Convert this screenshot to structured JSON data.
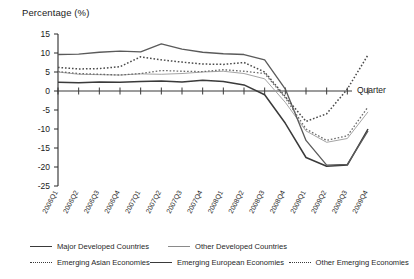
{
  "chart_data": {
    "type": "line",
    "title": "",
    "ylabel": "Percentage (%)",
    "xlabel": "Quarter",
    "ylim": [
      -25,
      15
    ],
    "yticks": [
      15,
      10,
      5,
      0,
      -5,
      -10,
      -15,
      -20,
      -25
    ],
    "grid": false,
    "legend_position": "bottom",
    "categories": [
      "2006Q1",
      "2006Q2",
      "2006Q3",
      "2006Q4",
      "2007Q1",
      "2007Q2",
      "2007Q3",
      "2007Q4",
      "2008Q1",
      "2008Q2",
      "2008Q3",
      "2008Q4",
      "2009Q1",
      "2009Q2",
      "2009Q3",
      "2009Q4"
    ],
    "series": [
      {
        "name": "Major Developed Countries",
        "style": "solid",
        "color": "#3a3a3a",
        "width": 1.5,
        "values": [
          2.3,
          2.2,
          2.4,
          2.3,
          2.5,
          2.6,
          2.4,
          2.8,
          2.5,
          1.6,
          -1.0,
          -8.5,
          -17.5,
          -19.8,
          -19.5,
          -10.0
        ]
      },
      {
        "name": "Other Developed Countries",
        "style": "solid",
        "color": "#9a9a9a",
        "width": 0.9,
        "values": [
          5.0,
          4.4,
          4.3,
          4.2,
          4.5,
          4.4,
          4.6,
          5.0,
          5.2,
          4.6,
          3.2,
          -3.0,
          -10.5,
          -13.5,
          -12.5,
          -5.5
        ]
      },
      {
        "name": "Emerging Asian Economies",
        "style": "dotted",
        "color": "#4a4a4a",
        "width": 1.5,
        "values": [
          6.2,
          5.8,
          5.9,
          6.4,
          9.0,
          8.2,
          7.6,
          7.1,
          7.0,
          7.5,
          5.0,
          -1.5,
          -8.0,
          -6.0,
          0.5,
          9.5
        ]
      },
      {
        "name": "Emerging European Economies",
        "style": "solid",
        "color": "#5a5a5a",
        "width": 1.3,
        "values": [
          9.6,
          9.7,
          10.2,
          10.5,
          10.3,
          12.4,
          11.0,
          10.2,
          9.8,
          9.6,
          8.2,
          0.5,
          -13.0,
          -19.5,
          -19.3,
          -10.5
        ]
      },
      {
        "name": "Other Emerging Economies",
        "style": "dotted",
        "color": "#6a6a6a",
        "width": 1.3,
        "values": [
          5.1,
          4.6,
          4.4,
          4.2,
          4.6,
          5.4,
          5.2,
          5.1,
          5.6,
          5.2,
          4.6,
          -1.8,
          -10.0,
          -13.0,
          -11.8,
          -4.2
        ]
      }
    ]
  },
  "axis": {
    "ylabel_text": "Percentage (%)",
    "xlabel_text": "Quarter"
  },
  "legend": {
    "rows": [
      [
        {
          "label": "Major Developed Countries",
          "style": "solid"
        },
        {
          "label": "Other Developed Countries",
          "style": "thin"
        }
      ],
      [
        {
          "label": "Emerging Asian Economies",
          "style": "dotted"
        },
        {
          "label": "Emerging European Economies",
          "style": "solid"
        },
        {
          "label": "Other Emerging Economies",
          "style": "dotted"
        }
      ]
    ]
  }
}
